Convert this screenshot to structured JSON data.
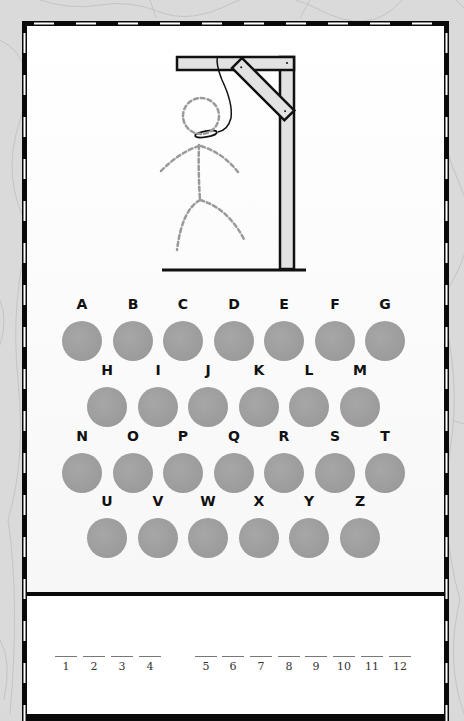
{
  "game": {
    "name": "Hangman",
    "colors": {
      "frame": "#0a0a0a",
      "letter_button": "#9e9e9e",
      "figure_dashed": "#9a9a9a",
      "gallows_fill": "#e0e0e0",
      "background": "#d9d9d9"
    }
  },
  "gallows": {
    "figure_state": "dashed-outline",
    "rope": "noose-icon"
  },
  "keyboard": {
    "rows": [
      {
        "y_label": 305,
        "y_circle": 341,
        "letters": [
          {
            "label": "A",
            "x": 82
          },
          {
            "label": "B",
            "x": 133
          },
          {
            "label": "C",
            "x": 183
          },
          {
            "label": "D",
            "x": 234
          },
          {
            "label": "E",
            "x": 284
          },
          {
            "label": "F",
            "x": 335
          },
          {
            "label": "G",
            "x": 385
          }
        ]
      },
      {
        "y_label": 371,
        "y_circle": 407,
        "letters": [
          {
            "label": "H",
            "x": 107
          },
          {
            "label": "I",
            "x": 158
          },
          {
            "label": "J",
            "x": 208
          },
          {
            "label": "K",
            "x": 259
          },
          {
            "label": "L",
            "x": 309
          },
          {
            "label": "M",
            "x": 360
          }
        ]
      },
      {
        "y_label": 437,
        "y_circle": 473,
        "letters": [
          {
            "label": "N",
            "x": 82
          },
          {
            "label": "O",
            "x": 133
          },
          {
            "label": "P",
            "x": 183
          },
          {
            "label": "Q",
            "x": 234
          },
          {
            "label": "R",
            "x": 284
          },
          {
            "label": "S",
            "x": 335
          },
          {
            "label": "T",
            "x": 385
          }
        ]
      },
      {
        "y_label": 502,
        "y_circle": 538,
        "letters": [
          {
            "label": "U",
            "x": 107
          },
          {
            "label": "V",
            "x": 158
          },
          {
            "label": "W",
            "x": 208
          },
          {
            "label": "X",
            "x": 259
          },
          {
            "label": "Y",
            "x": 309
          },
          {
            "label": "Z",
            "x": 360
          }
        ]
      }
    ]
  },
  "word": {
    "blanks": [
      {
        "num": "1",
        "x": 66
      },
      {
        "num": "2",
        "x": 94
      },
      {
        "num": "3",
        "x": 122
      },
      {
        "num": "4",
        "x": 150
      },
      {
        "num": "5",
        "x": 206
      },
      {
        "num": "6",
        "x": 233
      },
      {
        "num": "7",
        "x": 261
      },
      {
        "num": "8",
        "x": 289
      },
      {
        "num": "9",
        "x": 316
      },
      {
        "num": "10",
        "x": 344
      },
      {
        "num": "11",
        "x": 372
      },
      {
        "num": "12",
        "x": 400
      }
    ],
    "y": 656
  }
}
